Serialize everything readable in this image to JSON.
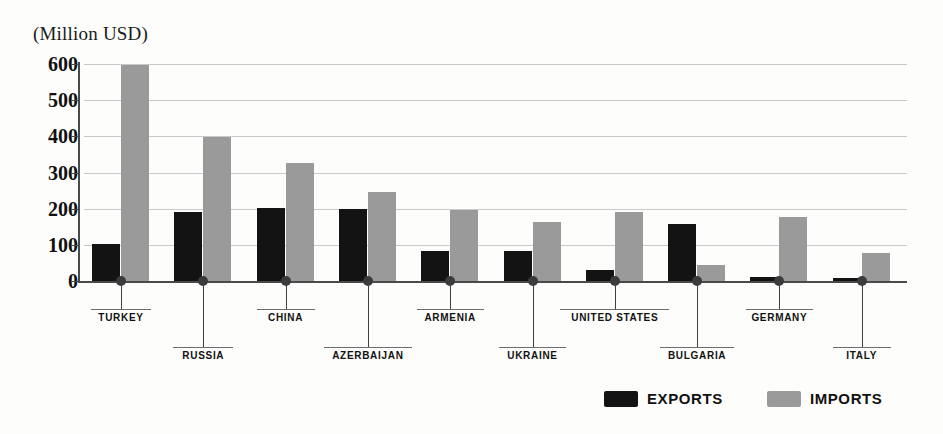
{
  "chart_data": {
    "type": "bar",
    "title": "(Million USD)",
    "xlabel": "",
    "ylabel": "(Million USD)",
    "ylim": [
      0,
      600
    ],
    "yticks": [
      0,
      100,
      200,
      300,
      400,
      500,
      600
    ],
    "grid": true,
    "legend_position": "bottom-right",
    "categories": [
      "TURKEY",
      "RUSSIA",
      "CHINA",
      "AZERBAIJAN",
      "ARMENIA",
      "UKRAINE",
      "UNITED STATES",
      "BULGARIA",
      "GERMANY",
      "ITALY"
    ],
    "series": [
      {
        "name": "EXPORTS",
        "color": "#131313",
        "values": [
          103,
          190,
          202,
          200,
          82,
          82,
          31,
          159,
          11,
          9
        ]
      },
      {
        "name": "IMPORTS",
        "color": "#9a9a9a",
        "values": [
          597,
          397,
          325,
          246,
          196,
          164,
          192,
          43,
          177,
          78
        ]
      }
    ]
  },
  "legend": {
    "items": [
      {
        "label": "EXPORTS",
        "swatch": "exports"
      },
      {
        "label": "IMPORTS",
        "swatch": "imports"
      }
    ]
  },
  "axis": {
    "tick_labels": [
      "600",
      "500",
      "400",
      "300",
      "200",
      "100",
      "0"
    ]
  }
}
